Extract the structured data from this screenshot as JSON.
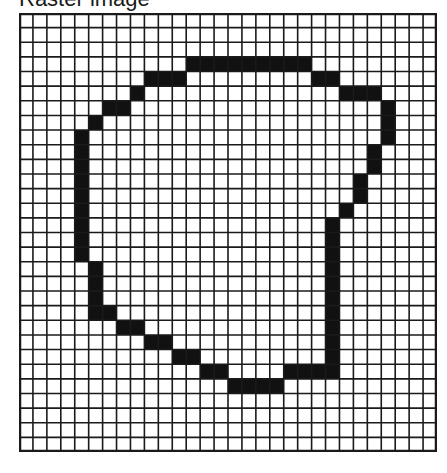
{
  "title": "Raster image",
  "grid": {
    "cols": 30,
    "rows": 30,
    "line_color": "#1a1a1a",
    "fill_color": "#111111",
    "background": "#ffffff",
    "filled_cells": {
      "3": [
        [
          12,
          20
        ]
      ],
      "4": [
        [
          9,
          11
        ],
        [
          21,
          22
        ]
      ],
      "5": [
        [
          8,
          8
        ],
        [
          23,
          25
        ]
      ],
      "6": [
        [
          6,
          7
        ],
        [
          26,
          26
        ]
      ],
      "7": [
        [
          5,
          5
        ],
        [
          26,
          26
        ]
      ],
      "8": [
        [
          4,
          4
        ],
        [
          26,
          26
        ]
      ],
      "9": [
        [
          4,
          4
        ],
        [
          25,
          25
        ]
      ],
      "10": [
        [
          4,
          4
        ],
        [
          25,
          25
        ]
      ],
      "11": [
        [
          4,
          4
        ],
        [
          24,
          24
        ]
      ],
      "12": [
        [
          4,
          4
        ],
        [
          24,
          24
        ]
      ],
      "13": [
        [
          4,
          4
        ],
        [
          23,
          23
        ]
      ],
      "14": [
        [
          4,
          4
        ],
        [
          22,
          22
        ]
      ],
      "15": [
        [
          4,
          4
        ],
        [
          22,
          22
        ]
      ],
      "16": [
        [
          4,
          4
        ],
        [
          22,
          22
        ]
      ],
      "17": [
        [
          5,
          5
        ],
        [
          22,
          22
        ]
      ],
      "18": [
        [
          5,
          5
        ],
        [
          22,
          22
        ]
      ],
      "19": [
        [
          5,
          5
        ],
        [
          22,
          22
        ]
      ],
      "20": [
        [
          5,
          6
        ],
        [
          22,
          22
        ]
      ],
      "21": [
        [
          7,
          8
        ],
        [
          22,
          22
        ]
      ],
      "22": [
        [
          9,
          10
        ],
        [
          22,
          22
        ]
      ],
      "23": [
        [
          11,
          12
        ],
        [
          22,
          22
        ]
      ],
      "24": [
        [
          13,
          14
        ],
        [
          19,
          22
        ]
      ],
      "25": [
        [
          15,
          18
        ]
      ]
    }
  }
}
